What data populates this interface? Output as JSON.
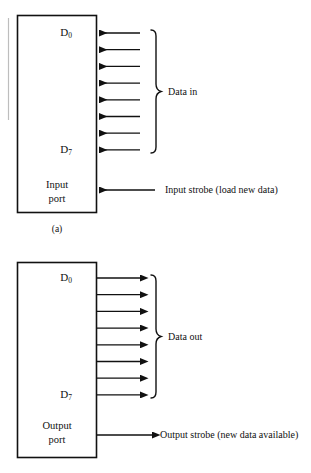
{
  "figure": {
    "caption_a": "(a)",
    "edge_artifact": "page-edge-scan-line"
  },
  "diagrams": [
    {
      "id": "input-port",
      "box_label_line1": "Input",
      "box_label_line2": "port",
      "bus_top_label": "D",
      "bus_top_sub": "0",
      "bus_bottom_label": "D",
      "bus_bottom_sub": "7",
      "bus_group_label": "Data in",
      "strobe_label": "Input strobe (load new data)",
      "data_direction": "left",
      "strobe_direction": "left",
      "line_count": 8
    },
    {
      "id": "output-port",
      "box_label_line1": "Output",
      "box_label_line2": "port",
      "bus_top_label": "D",
      "bus_top_sub": "0",
      "bus_bottom_label": "D",
      "bus_bottom_sub": "7",
      "bus_group_label": "Data out",
      "strobe_label": "Output strobe (new data available)",
      "data_direction": "right",
      "strobe_direction": "right",
      "line_count": 8
    }
  ],
  "colors": {
    "ink": "#111111",
    "background": "#ffffff",
    "artifact": "#b9b9b9"
  }
}
